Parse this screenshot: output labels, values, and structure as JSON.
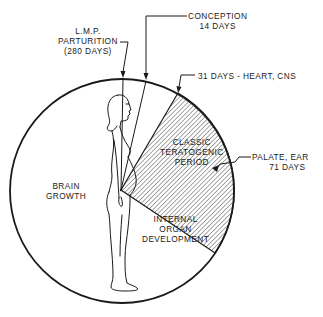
{
  "diagram": {
    "type": "radial-timeline",
    "colors": {
      "ink": "#1a1a1a",
      "background": "#ffffff",
      "hatch": "#3a3a3a"
    }
  },
  "labels": {
    "lmp": {
      "line1": "L.M.P.",
      "line2": "PARTURITION",
      "line3": "(280 DAYS)"
    },
    "conception": {
      "line1": "CONCEPTION",
      "line2": "14 DAYS"
    },
    "heart_cns": {
      "line1": "31 DAYS - HEART, CNS"
    },
    "palate_ear": {
      "line1": "PALATE, EAR",
      "line2": "71 DAYS"
    },
    "teratogenic": {
      "line1": "CLASSIC",
      "line2": "TERATOGENIC",
      "line3": "PERIOD"
    },
    "brain": {
      "line1": "BRAIN",
      "line2": "GROWTH"
    },
    "organ": {
      "line1": "INTERNAL",
      "line2": "ORGAN",
      "line3": "DEVELOPMENT"
    }
  },
  "milestones": [
    {
      "name": "L.M.P. / Parturition",
      "day": 0,
      "alt_day": 280
    },
    {
      "name": "Conception",
      "day": 14
    },
    {
      "name": "Heart, CNS",
      "day": 31
    },
    {
      "name": "Palate, Ear",
      "day": 71
    }
  ]
}
